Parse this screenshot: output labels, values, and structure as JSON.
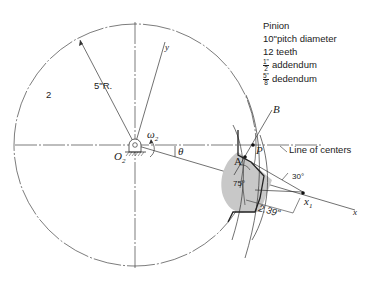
{
  "specs": {
    "title": "Pinion",
    "pitch_diameter": "10\"pitch diameter",
    "teeth": "12 teeth",
    "addendum": {
      "num": "1\"",
      "den": "2",
      "label": "addendum"
    },
    "dedendum": {
      "num": "5\"",
      "den": "8",
      "label": "dedendum"
    }
  },
  "labels": {
    "gear_number": "2",
    "radius": "5\"R.",
    "y_axis": "y",
    "x_axis": "x",
    "pivot": "O",
    "pivot_sub": "2",
    "omega": "ω",
    "omega_sub": "2",
    "theta": "θ",
    "point_A": "A",
    "point_P": "P",
    "point_B": "B",
    "x1": "x",
    "x1_sub": "1",
    "line_of_centers": "Line of centers",
    "angle_30": "30°",
    "angle_75": "75°",
    "distance": "2.39\""
  },
  "colors": {
    "line": "#333333",
    "tooth_fill": "#c8c8c8"
  }
}
